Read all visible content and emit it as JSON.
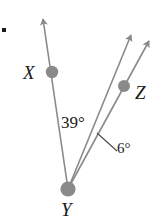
{
  "figure": {
    "type": "geometry-diagram",
    "width": 159,
    "height": 219,
    "background_color": "#ffffff",
    "stroke_color": "#8a8a8a",
    "point_color": "#8a8a8a",
    "text_color": "#1a1a1a",
    "bullet": {
      "name": "bullet-mark",
      "color": "#1a1a1a"
    },
    "vertex": {
      "label": "Y",
      "x": 68,
      "y": 189
    },
    "points": [
      {
        "label": "X",
        "x": 52,
        "y": 72
      },
      {
        "label": "Z",
        "x": 124,
        "y": 86
      }
    ],
    "rays": [
      {
        "name": "ray-YX",
        "from": [
          68,
          189
        ],
        "to": [
          42,
          15
        ],
        "arrow": true
      },
      {
        "name": "ray-YZ",
        "from": [
          68,
          189
        ],
        "to": [
          133,
          30
        ],
        "arrow": true
      },
      {
        "name": "ray-YW",
        "from": [
          68,
          189
        ],
        "to": [
          152,
          36
        ],
        "arrow": true
      }
    ],
    "angles": [
      {
        "name": "angle-XYZ",
        "value": "39°",
        "between": [
          "ray-YX",
          "ray-YZ"
        ]
      },
      {
        "name": "angle-ZYW",
        "value": "6°",
        "between": [
          "ray-YZ",
          "ray-YW"
        ],
        "leader_line": {
          "from": [
            98,
            134
          ],
          "to": [
            116,
            150
          ]
        }
      }
    ]
  }
}
